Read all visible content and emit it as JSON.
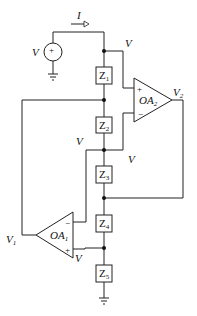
{
  "diagram": {
    "type": "circuit",
    "current_label": "I",
    "source": {
      "label": "V",
      "polarity": "+"
    },
    "impedances": [
      {
        "name": "Z",
        "sub": "1"
      },
      {
        "name": "Z",
        "sub": "2"
      },
      {
        "name": "Z",
        "sub": "3"
      },
      {
        "name": "Z",
        "sub": "4"
      },
      {
        "name": "Z",
        "sub": "5"
      }
    ],
    "opamps": [
      {
        "name": "OA",
        "sub": "1",
        "plus": "+",
        "minus": "−",
        "output_label": "V",
        "output_sub": "1"
      },
      {
        "name": "OA",
        "sub": "2",
        "plus": "+",
        "minus": "−",
        "output_label": "V",
        "output_sub": "2"
      }
    ],
    "node_labels": [
      "V",
      "V",
      "V",
      "V"
    ]
  }
}
